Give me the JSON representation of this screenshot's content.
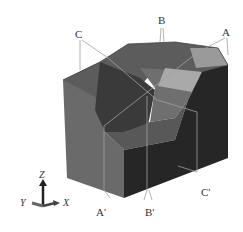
{
  "figure": {
    "section_labels": {
      "A": "A",
      "A_prime": "A'",
      "B": "B",
      "B_prime": "B'",
      "C": "C",
      "C_prime": "C'"
    },
    "axes": {
      "z": "Z",
      "y": "Y",
      "x": "X"
    },
    "colors": {
      "background": "#ffffff",
      "face_light": "#6e6e6e",
      "face_mid": "#555555",
      "face_dark": "#2a2a2a",
      "face_highlight": "#a8a8a8",
      "section_line": "#9a9a9a",
      "label": "#333333"
    }
  }
}
